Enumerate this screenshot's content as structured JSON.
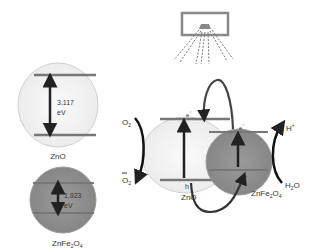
{
  "diagram": {
    "left_zno": {
      "label": "ZnO",
      "gap_value": "3.117",
      "gap_unit": "eV"
    },
    "left_znfe2o4": {
      "label_main": "ZnFe",
      "label_sub1": "2",
      "label_mid": "O",
      "label_sub2": "4",
      "gap_value": "1.923",
      "gap_unit": "eV"
    },
    "center_zno": {
      "label": "ZnO",
      "electron": "e",
      "hole": "h"
    },
    "center_znfe2o4": {
      "label_main": "ZnFe",
      "label_sub1": "2",
      "label_mid": "O",
      "label_sub2": "4",
      "electron": "e",
      "hole": "h"
    },
    "oxygen": {
      "top": "O",
      "top_sub": "2",
      "bottom": "O",
      "bottom_sub": "2"
    },
    "water": {
      "top": "H",
      "top_sup": "+",
      "bottom": "H",
      "bottom_sub": "2",
      "bottom_end": "O"
    },
    "icons": {
      "light_source": "lamp-icon"
    },
    "colors": {
      "light_fill": "#f4f4f4",
      "dark_fill": "#8c8c8c",
      "band": "#7a7a7a",
      "arrow": "#222222"
    }
  }
}
